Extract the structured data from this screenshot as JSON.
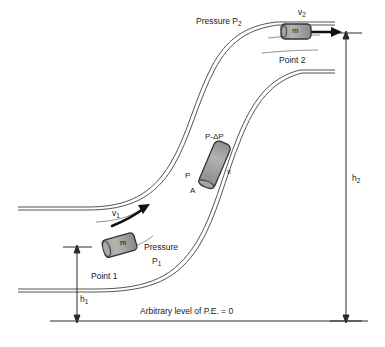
{
  "figure": {
    "baseline_label": "Arbitrary level of P.E. = 0",
    "colors": {
      "line": "#4d4d4d",
      "text": "#1a1a1a",
      "block_fill": "#9a9a9a",
      "block_stroke": "#3a3a3a",
      "arrow": "#111111",
      "background": "#ffffff"
    }
  },
  "labels": {
    "pressure_2": "Pressure P",
    "pressure_2_sub": "2",
    "pressure_1": "Pressure",
    "pressure_1_line2": "P",
    "pressure_1_sub": "1",
    "point_1": "Point 1",
    "point_2": "Point 2",
    "velocity_1": "v",
    "velocity_1_sub": "1",
    "velocity_2": "v",
    "velocity_2_sub": "2",
    "height_1": "h",
    "height_1_sub": "1",
    "height_2": "h",
    "height_2_sub": "2",
    "mass_1": "m",
    "mass_2": "m",
    "pressure_element_top": "P-ΔP",
    "pressure_element_bottom": "P",
    "area": "A",
    "displacement": "x"
  },
  "elements": {
    "block_1_name": "fluid-mass-element-point-1",
    "block_2_name": "fluid-mass-element-point-2",
    "block_mid_name": "fluid-pressure-element"
  }
}
